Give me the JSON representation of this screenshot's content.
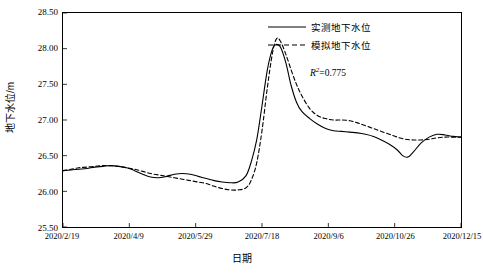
{
  "chart_data": {
    "type": "line",
    "title": "",
    "xlabel": "日期",
    "ylabel": "地下水位/m",
    "ylim": [
      25.5,
      28.5
    ],
    "yticks": [
      25.5,
      26.0,
      26.5,
      27.0,
      27.5,
      28.0,
      28.5
    ],
    "ytick_labels": [
      "25.50",
      "26.00",
      "26.50",
      "27.00",
      "27.50",
      "28.00",
      "28.50"
    ],
    "xtick_labels": [
      "2020/2/19",
      "2020/4/9",
      "2020/5/29",
      "2020/7/18",
      "2020/9/6",
      "2020/10/26",
      "2020/12/15"
    ],
    "xlim_days": [
      0,
      300
    ],
    "xticks_days": [
      0,
      50,
      100,
      150,
      200,
      250,
      300
    ],
    "grid": false,
    "legend_position": "top-right",
    "annotations": [
      {
        "text_prefix": "R",
        "text_sup": "2",
        "text_suffix": "=0.775"
      }
    ],
    "series": [
      {
        "name": "实测地下水位",
        "style": "solid",
        "color": "#000000",
        "points": [
          [
            0,
            26.29
          ],
          [
            6,
            26.3
          ],
          [
            12,
            26.31
          ],
          [
            18,
            26.32
          ],
          [
            24,
            26.34
          ],
          [
            30,
            26.35
          ],
          [
            36,
            26.36
          ],
          [
            42,
            26.35
          ],
          [
            48,
            26.33
          ],
          [
            54,
            26.29
          ],
          [
            60,
            26.24
          ],
          [
            66,
            26.2
          ],
          [
            72,
            26.19
          ],
          [
            78,
            26.21
          ],
          [
            84,
            26.24
          ],
          [
            90,
            26.25
          ],
          [
            96,
            26.24
          ],
          [
            102,
            26.21
          ],
          [
            108,
            26.18
          ],
          [
            114,
            26.15
          ],
          [
            120,
            26.13
          ],
          [
            126,
            26.12
          ],
          [
            132,
            26.13
          ],
          [
            138,
            26.22
          ],
          [
            142,
            26.42
          ],
          [
            146,
            26.72
          ],
          [
            150,
            27.2
          ],
          [
            154,
            27.7
          ],
          [
            158,
            28.0
          ],
          [
            161,
            28.06
          ],
          [
            164,
            28.02
          ],
          [
            168,
            27.8
          ],
          [
            172,
            27.48
          ],
          [
            176,
            27.25
          ],
          [
            180,
            27.12
          ],
          [
            186,
            27.02
          ],
          [
            192,
            26.94
          ],
          [
            198,
            26.88
          ],
          [
            204,
            26.85
          ],
          [
            210,
            26.84
          ],
          [
            216,
            26.83
          ],
          [
            222,
            26.82
          ],
          [
            228,
            26.8
          ],
          [
            234,
            26.77
          ],
          [
            240,
            26.72
          ],
          [
            246,
            26.66
          ],
          [
            252,
            26.58
          ],
          [
            256,
            26.5
          ],
          [
            260,
            26.48
          ],
          [
            264,
            26.55
          ],
          [
            270,
            26.68
          ],
          [
            276,
            26.76
          ],
          [
            282,
            26.8
          ],
          [
            288,
            26.79
          ],
          [
            294,
            26.77
          ],
          [
            300,
            26.76
          ]
        ]
      },
      {
        "name": "模拟地下水位",
        "style": "dashed",
        "color": "#000000",
        "points": [
          [
            0,
            26.29
          ],
          [
            6,
            26.31
          ],
          [
            12,
            26.33
          ],
          [
            18,
            26.34
          ],
          [
            24,
            26.35
          ],
          [
            30,
            26.36
          ],
          [
            36,
            26.36
          ],
          [
            42,
            26.35
          ],
          [
            48,
            26.33
          ],
          [
            54,
            26.31
          ],
          [
            60,
            26.28
          ],
          [
            66,
            26.25
          ],
          [
            72,
            26.23
          ],
          [
            78,
            26.21
          ],
          [
            84,
            26.19
          ],
          [
            90,
            26.17
          ],
          [
            96,
            26.15
          ],
          [
            102,
            26.13
          ],
          [
            108,
            26.11
          ],
          [
            114,
            26.07
          ],
          [
            120,
            26.04
          ],
          [
            126,
            26.02
          ],
          [
            132,
            26.02
          ],
          [
            138,
            26.05
          ],
          [
            142,
            26.16
          ],
          [
            146,
            26.4
          ],
          [
            150,
            26.85
          ],
          [
            154,
            27.45
          ],
          [
            158,
            27.95
          ],
          [
            161,
            28.14
          ],
          [
            164,
            28.1
          ],
          [
            168,
            27.92
          ],
          [
            172,
            27.7
          ],
          [
            176,
            27.5
          ],
          [
            180,
            27.34
          ],
          [
            186,
            27.16
          ],
          [
            192,
            27.06
          ],
          [
            198,
            27.02
          ],
          [
            204,
            27.0
          ],
          [
            210,
            27.0
          ],
          [
            216,
            26.99
          ],
          [
            222,
            26.96
          ],
          [
            228,
            26.92
          ],
          [
            234,
            26.88
          ],
          [
            240,
            26.84
          ],
          [
            246,
            26.8
          ],
          [
            252,
            26.76
          ],
          [
            258,
            26.73
          ],
          [
            264,
            26.72
          ],
          [
            270,
            26.72
          ],
          [
            276,
            26.73
          ],
          [
            282,
            26.75
          ],
          [
            288,
            26.76
          ],
          [
            294,
            26.76
          ],
          [
            300,
            26.76
          ]
        ]
      }
    ]
  }
}
